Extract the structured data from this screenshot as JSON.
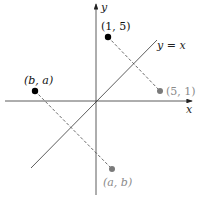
{
  "diagram": {
    "axes": {
      "x_label": "x",
      "y_label": "y"
    },
    "line": {
      "label": "y = x"
    },
    "points": [
      {
        "id": "p15",
        "label": "(1, 5)",
        "color": "#000000"
      },
      {
        "id": "p51",
        "label": "(5, 1)",
        "color": "#7a7a7a"
      },
      {
        "id": "pba",
        "label": "(b, a)",
        "color": "#000000"
      },
      {
        "id": "pab",
        "label": "(a, b)",
        "color": "#7a7a7a"
      }
    ],
    "colors": {
      "axis": "#333333",
      "dark_point": "#000000",
      "gray_point": "#7a7a7a",
      "gray_text": "#8a8a8a"
    }
  }
}
